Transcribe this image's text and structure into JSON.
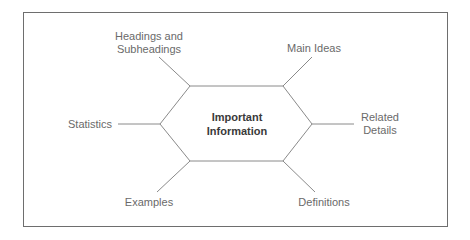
{
  "diagram": {
    "type": "concept-web",
    "center": {
      "line1": "Important",
      "line2": "Information"
    },
    "nodes": {
      "headings": {
        "line1": "Headings and",
        "line2": "Subheadings"
      },
      "main_ideas": {
        "label": "Main Ideas"
      },
      "related": {
        "line1": "Related",
        "line2": "Details"
      },
      "statistics": {
        "label": "Statistics"
      },
      "examples": {
        "label": "Examples"
      },
      "definitions": {
        "label": "Definitions"
      }
    },
    "colors": {
      "line": "#8a8a8a",
      "frame": "#6e6e6e",
      "label": "#6a6a6a",
      "center_text": "#3a3a3a"
    }
  }
}
